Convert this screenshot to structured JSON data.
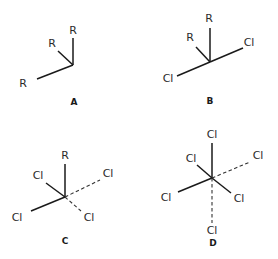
{
  "diagram": {
    "type": "chemical-structures",
    "colors": {
      "line": "#1a1a1a",
      "dash": "#333333",
      "text": "#2a2a2a",
      "background": "#ffffff"
    },
    "structures": [
      {
        "label": "A",
        "center": [
          73,
          65
        ],
        "substituents": [
          {
            "atom": "R",
            "pos": [
              73,
              34
            ],
            "bond": [
              73,
              38
            ],
            "style": "solid"
          },
          {
            "atom": "R",
            "pos": [
              52,
              47
            ],
            "bond": [
              58,
              51
            ],
            "style": "solid"
          },
          {
            "atom": "R",
            "pos": [
              23,
              87
            ],
            "bond": [
              37,
              79
            ],
            "style": "solid"
          }
        ],
        "label_pos": [
          74,
          105
        ]
      },
      {
        "label": "B",
        "center": [
          210,
          62
        ],
        "substituents": [
          {
            "atom": "R",
            "pos": [
              209,
              22
            ],
            "bond": [
              210,
              28
            ],
            "style": "solid"
          },
          {
            "atom": "R",
            "pos": [
              190,
              41
            ],
            "bond": [
              196,
              47
            ],
            "style": "solid"
          },
          {
            "atom": "Cl",
            "pos": [
              249,
              46
            ],
            "bond": [
              243,
              48
            ],
            "style": "solid"
          },
          {
            "atom": "Cl",
            "pos": [
              168,
              82
            ],
            "bond": [
              177,
              76
            ],
            "style": "solid"
          }
        ],
        "label_pos": [
          210,
          104
        ]
      },
      {
        "label": "C",
        "center": [
          65,
          197
        ],
        "substituents": [
          {
            "atom": "R",
            "pos": [
              65,
              159
            ],
            "bond": [
              65,
              164
            ],
            "style": "solid"
          },
          {
            "atom": "Cl",
            "pos": [
              38,
              179
            ],
            "bond": [
              46,
              183
            ],
            "style": "solid"
          },
          {
            "atom": "Cl",
            "pos": [
              108,
              177
            ],
            "bond": [
              100,
              180
            ],
            "style": "dashed"
          },
          {
            "atom": "Cl",
            "pos": [
              17,
              221
            ],
            "bond": [
              31,
              211
            ],
            "style": "solid"
          },
          {
            "atom": "Cl",
            "pos": [
              89,
              221
            ],
            "bond": [
              81,
              211
            ],
            "style": "dashed"
          }
        ],
        "label_pos": [
          65,
          244
        ]
      },
      {
        "label": "D",
        "center": [
          212,
          178
        ],
        "substituents": [
          {
            "atom": "Cl",
            "pos": [
              212,
              138
            ],
            "bond": [
              212,
              143
            ],
            "style": "solid"
          },
          {
            "atom": "Cl",
            "pos": [
              191,
              162
            ],
            "bond": [
              197,
              165
            ],
            "style": "solid"
          },
          {
            "atom": "Cl",
            "pos": [
              258,
              159
            ],
            "bond": [
              250,
              162
            ],
            "style": "dashed"
          },
          {
            "atom": "Cl",
            "pos": [
              166,
              201
            ],
            "bond": [
              178,
              192
            ],
            "style": "solid"
          },
          {
            "atom": "Cl",
            "pos": [
              239,
              202
            ],
            "bond": [
              231,
              193
            ],
            "style": "solid"
          },
          {
            "atom": "Cl",
            "pos": [
              212,
              234
            ],
            "bond": [
              212,
              223
            ],
            "style": "dashed"
          }
        ],
        "label_pos": [
          213,
          246
        ]
      }
    ]
  }
}
